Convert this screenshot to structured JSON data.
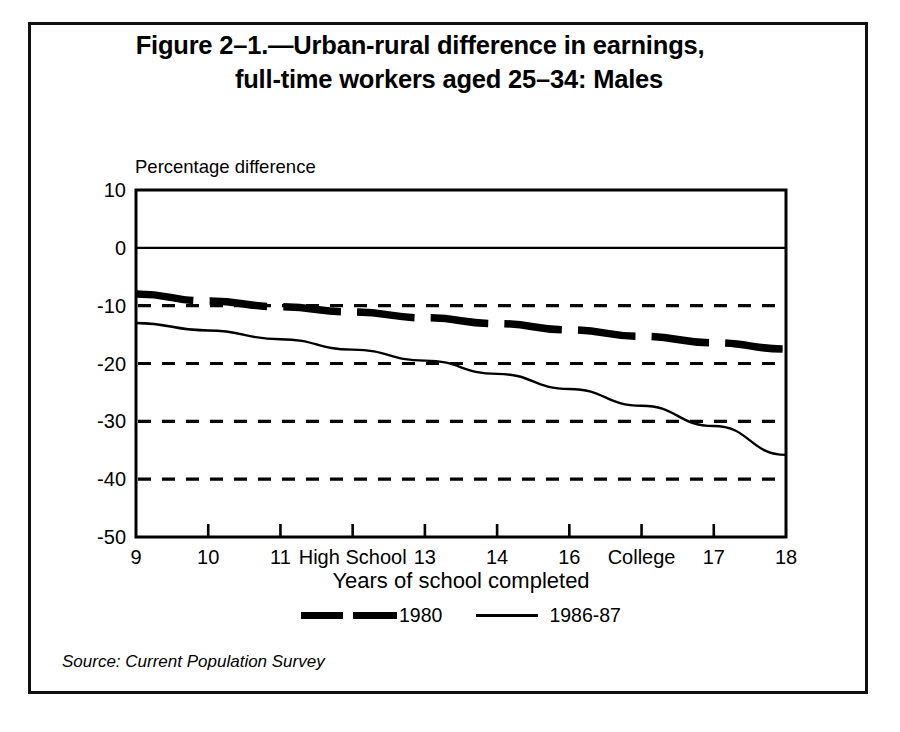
{
  "figure": {
    "title_line_1": "Figure 2–1.—Urban-rural difference in earnings,",
    "title_line_2": "full-time workers aged 25–34: Males",
    "source_note": "Source: Current Population Survey"
  },
  "chart_data": {
    "type": "line",
    "title": "Figure 2–1.—Urban-rural difference in earnings, full-time workers aged 25–34: Males",
    "xlabel": "Years of school completed",
    "ylabel": "Percentage difference",
    "xlim": [
      9,
      18
    ],
    "ylim": [
      -50,
      10
    ],
    "yticks": [
      10,
      0,
      -10,
      -20,
      -30,
      -40,
      -50
    ],
    "ytick_labels": [
      "10",
      "0",
      "-10",
      "-20",
      "-30",
      "-40",
      "-50"
    ],
    "xticks": [
      9,
      10,
      11,
      12,
      13,
      14,
      15,
      16,
      17,
      18
    ],
    "xtick_labels": [
      "9",
      "10",
      "11",
      "High School",
      "13",
      "14",
      "16",
      "College",
      "17",
      "18"
    ],
    "grid": "horizontal dashed gridlines at -10, -20, -30, -40; solid zero line at 0",
    "gridlines": [
      -10,
      -20,
      -30,
      -40
    ],
    "zero_line": 0,
    "legend_position": "below axis, centered",
    "series": [
      {
        "name": "1980",
        "style": "thick-dashed",
        "x": [
          9,
          10,
          11,
          12,
          13,
          14,
          15,
          16,
          17,
          18
        ],
        "values": [
          -8.0,
          -9.2,
          -10.2,
          -11.1,
          -12.1,
          -13.1,
          -14.2,
          -15.3,
          -16.4,
          -17.5
        ]
      },
      {
        "name": "1986-87",
        "style": "thin-solid",
        "x": [
          9,
          10,
          11,
          12,
          13,
          14,
          15,
          16,
          17,
          18
        ],
        "values": [
          -13.0,
          -14.3,
          -15.8,
          -17.6,
          -19.5,
          -21.8,
          -24.4,
          -27.3,
          -30.8,
          -35.8
        ]
      }
    ],
    "annotations": []
  },
  "legend": {
    "items": [
      {
        "label": "1980",
        "swatch": "thick-dashed-line-swatch"
      },
      {
        "label": "1986-87",
        "swatch": "thin-solid-line-swatch"
      }
    ]
  }
}
